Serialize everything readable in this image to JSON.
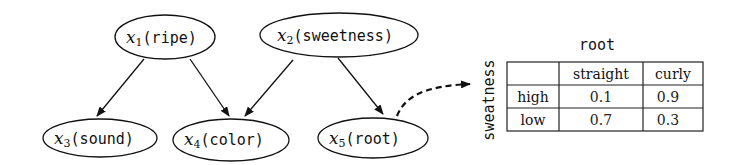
{
  "diagram": {
    "nodes": [
      {
        "id": "x1",
        "var": "x",
        "sub": "1",
        "label": "(ripe)"
      },
      {
        "id": "x2",
        "var": "x",
        "sub": "2",
        "label": "(sweetness)"
      },
      {
        "id": "x3",
        "var": "x",
        "sub": "3",
        "label": "(sound)"
      },
      {
        "id": "x4",
        "var": "x",
        "sub": "4",
        "label": "(color)"
      },
      {
        "id": "x5",
        "var": "x",
        "sub": "5",
        "label": "(root)"
      }
    ],
    "edges": [
      {
        "from": "x1",
        "to": "x3"
      },
      {
        "from": "x1",
        "to": "x4"
      },
      {
        "from": "x2",
        "to": "x4"
      },
      {
        "from": "x2",
        "to": "x5"
      },
      {
        "from": "x5",
        "to": "cpt-table",
        "style": "dashed"
      }
    ]
  },
  "cpt": {
    "column_title": "root",
    "row_title": "sweatness",
    "columns": [
      "",
      "straight",
      "curly"
    ],
    "rows": [
      {
        "label": "high",
        "values": [
          "0.1",
          "0.9"
        ]
      },
      {
        "label": "low",
        "values": [
          "0.7",
          "0.3"
        ]
      }
    ]
  }
}
